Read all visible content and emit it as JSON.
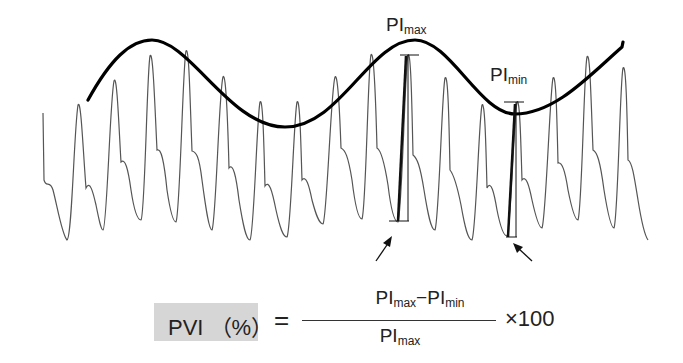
{
  "labels": {
    "pi_max": {
      "main": "PI",
      "sub": "max"
    },
    "pi_min": {
      "main": "PI",
      "sub": "min"
    }
  },
  "formula": {
    "lhs": "PVI （%）",
    "equals": "=",
    "numerator": {
      "a_main": "PI",
      "a_sub": "max",
      "minus": "−",
      "b_main": "PI",
      "b_sub": "min"
    },
    "denominator": {
      "main": "PI",
      "sub": "max"
    },
    "multiplier": "×100"
  },
  "colors": {
    "waveform": "#555555",
    "envelope": "#000000",
    "lhs_box": "#d6d6d6"
  },
  "waveform": {
    "description": "Plethysmographic pulse waveform with respiratory variation",
    "peaks": 16,
    "annotations": [
      "PImax amplitude bracket",
      "PImin amplitude bracket",
      "arrow to PImax trough",
      "arrow to PImin trough"
    ]
  }
}
